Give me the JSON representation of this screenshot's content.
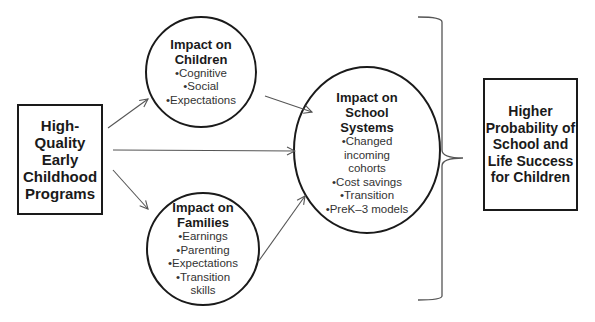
{
  "diagram": {
    "source": {
      "label": "High-Quality Early Childhood Programs",
      "lines": [
        "High-",
        "Quality",
        "Early",
        "Childhood",
        "Programs"
      ]
    },
    "children": {
      "title_lines": [
        "Impact on",
        "Children"
      ],
      "items": [
        "•Cognitive",
        "•Social",
        "•Expectations"
      ]
    },
    "families": {
      "title_lines": [
        "Impact on",
        "Families"
      ],
      "items": [
        "•Earnings",
        "•Parenting",
        "•Expectations",
        "•Transition",
        "skills"
      ]
    },
    "school": {
      "title_lines": [
        "Impact on",
        "School",
        "Systems"
      ],
      "items": [
        "•Changed",
        "incoming",
        "cohorts",
        "•Cost savings",
        "•Transition",
        "•PreK–3 models"
      ]
    },
    "outcome": {
      "lines": [
        "Higher",
        "Probability of",
        "School and",
        "Life Success",
        "for Children"
      ]
    },
    "colors": {
      "line": "#1a1a1a",
      "arrow": "#555555",
      "text": "#1a1a1a"
    }
  }
}
